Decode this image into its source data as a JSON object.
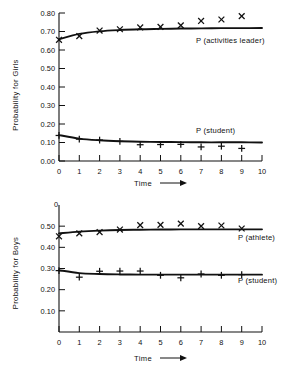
{
  "figure": {
    "name": "two-panel-probability-figure",
    "background": "#ffffff",
    "ink": "#111111"
  },
  "chart_data": [
    {
      "type": "line",
      "panel": "top",
      "title": "",
      "xlabel": "Time",
      "ylabel": "Probability for Girls",
      "xlim": [
        0,
        10
      ],
      "ylim": [
        0.0,
        0.8
      ],
      "grid": false,
      "legend_position": "inline-right",
      "x": [
        0,
        1,
        2,
        3,
        4,
        5,
        6,
        7,
        8,
        9
      ],
      "xticks": [
        "0",
        "1",
        "2",
        "3",
        "4",
        "5",
        "6",
        "7",
        "8",
        "9",
        "10"
      ],
      "yticks": [
        "0.00",
        "0.10",
        "0.20",
        "0.30",
        "0.40",
        "0.50",
        "0.60",
        "0.70",
        "0.80"
      ],
      "series": [
        {
          "name": "P (activities leader)",
          "marker": "x",
          "values": [
            0.655,
            0.675,
            0.705,
            0.712,
            0.722,
            0.725,
            0.733,
            0.757,
            0.765,
            0.783
          ],
          "fit": [
            0.658,
            0.687,
            0.701,
            0.708,
            0.712,
            0.714,
            0.716,
            0.717,
            0.718,
            0.718,
            0.719
          ]
        },
        {
          "name": "P (student)",
          "marker": "plus",
          "values": [
            0.138,
            0.118,
            0.113,
            0.106,
            0.088,
            0.089,
            0.09,
            0.076,
            0.08,
            0.068
          ],
          "fit": [
            0.14,
            0.121,
            0.112,
            0.107,
            0.104,
            0.103,
            0.102,
            0.101,
            0.101,
            0.101,
            0.1
          ]
        }
      ]
    },
    {
      "type": "line",
      "panel": "bottom",
      "title": "",
      "xlabel": "Time",
      "ylabel": "Probability for Boys",
      "xlim": [
        0,
        10
      ],
      "ylim": [
        0.0,
        0.6
      ],
      "grid": false,
      "legend_position": "inline-right",
      "x": [
        0,
        1,
        2,
        3,
        4,
        5,
        6,
        7,
        8,
        9
      ],
      "xticks": [
        "0",
        "1",
        "2",
        "3",
        "4",
        "5",
        "6",
        "7",
        "8",
        "9",
        "10"
      ],
      "yticks": [
        "0.10",
        "0.20",
        "0.30",
        "0.40",
        "0.50",
        "0"
      ],
      "series": [
        {
          "name": "P (athlete)",
          "marker": "x",
          "values": [
            0.452,
            0.466,
            0.472,
            0.484,
            0.505,
            0.506,
            0.512,
            0.5,
            0.503,
            0.489
          ],
          "fit": [
            0.466,
            0.474,
            0.479,
            0.482,
            0.483,
            0.484,
            0.485,
            0.485,
            0.485,
            0.485,
            0.485
          ]
        },
        {
          "name": "P (student)",
          "marker": "plus",
          "values": [
            0.29,
            0.259,
            0.287,
            0.288,
            0.288,
            0.268,
            0.256,
            0.274,
            0.268,
            0.271
          ],
          "fit": [
            0.292,
            0.278,
            0.274,
            0.272,
            0.271,
            0.271,
            0.271,
            0.271,
            0.271,
            0.271,
            0.271
          ]
        }
      ]
    }
  ]
}
